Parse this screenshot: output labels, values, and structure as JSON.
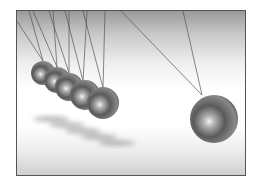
{
  "image": {
    "subject": "Newton's cradle",
    "description": "Five chrome balls suspended at left with one ball swung out to the right",
    "frame_color": "#555555",
    "ball_color": "#6e6e6e",
    "string_color": "#555555"
  }
}
